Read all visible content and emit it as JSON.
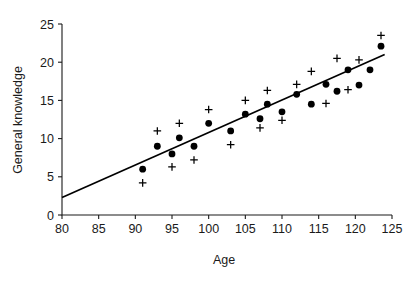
{
  "chart_data": {
    "type": "scatter",
    "title": "",
    "xlabel": "Age",
    "ylabel": "General knowledge",
    "xlim": [
      80,
      125
    ],
    "ylim": [
      0,
      25
    ],
    "xticks": [
      80,
      85,
      90,
      95,
      100,
      105,
      110,
      115,
      120,
      125
    ],
    "xticklabels": [
      "80",
      "85",
      "90",
      "95",
      "100",
      "105",
      "110",
      "115",
      "120",
      "125"
    ],
    "yticks": [
      0,
      5,
      10,
      15,
      20,
      25
    ],
    "yticklabels": [
      "0",
      "5",
      "10",
      "15",
      "20",
      "25"
    ],
    "grid": false,
    "legend": null,
    "series": [
      {
        "name": "filled-circle",
        "marker": "circle",
        "color": "#000000",
        "points": [
          {
            "x": 91.0,
            "y": 6.0
          },
          {
            "x": 93.0,
            "y": 9.0
          },
          {
            "x": 95.0,
            "y": 8.0
          },
          {
            "x": 96.0,
            "y": 10.1
          },
          {
            "x": 98.0,
            "y": 9.0
          },
          {
            "x": 100.0,
            "y": 12.0
          },
          {
            "x": 103.0,
            "y": 11.0
          },
          {
            "x": 105.0,
            "y": 13.2
          },
          {
            "x": 107.0,
            "y": 12.6
          },
          {
            "x": 108.0,
            "y": 14.5
          },
          {
            "x": 110.0,
            "y": 13.5
          },
          {
            "x": 112.0,
            "y": 15.8
          },
          {
            "x": 114.0,
            "y": 14.5
          },
          {
            "x": 116.0,
            "y": 17.1
          },
          {
            "x": 117.5,
            "y": 16.2
          },
          {
            "x": 119.0,
            "y": 19.0
          },
          {
            "x": 120.5,
            "y": 17.0
          },
          {
            "x": 122.0,
            "y": 19.0
          },
          {
            "x": 123.5,
            "y": 22.1
          }
        ]
      },
      {
        "name": "plus-cross",
        "marker": "plus",
        "color": "#000000",
        "points": [
          {
            "x": 91.0,
            "y": 4.2
          },
          {
            "x": 93.0,
            "y": 11.0
          },
          {
            "x": 95.0,
            "y": 6.3
          },
          {
            "x": 96.0,
            "y": 12.0
          },
          {
            "x": 98.0,
            "y": 7.2
          },
          {
            "x": 100.0,
            "y": 13.8
          },
          {
            "x": 103.0,
            "y": 9.2
          },
          {
            "x": 105.0,
            "y": 15.0
          },
          {
            "x": 107.0,
            "y": 11.4
          },
          {
            "x": 108.0,
            "y": 16.3
          },
          {
            "x": 110.0,
            "y": 12.4
          },
          {
            "x": 112.0,
            "y": 17.1
          },
          {
            "x": 114.0,
            "y": 18.8
          },
          {
            "x": 116.0,
            "y": 14.6
          },
          {
            "x": 117.5,
            "y": 20.5
          },
          {
            "x": 119.0,
            "y": 16.4
          },
          {
            "x": 120.5,
            "y": 20.3
          },
          {
            "x": 123.5,
            "y": 23.5
          }
        ]
      }
    ],
    "fit_line": {
      "name": "regression-line",
      "x0": 80.0,
      "y0": 2.3,
      "x1": 124.0,
      "y1": 21.0,
      "color": "#000000"
    }
  }
}
